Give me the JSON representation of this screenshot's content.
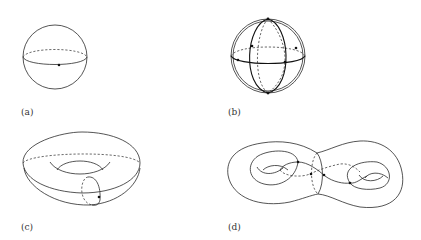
{
  "figure": {
    "panels": [
      {
        "id": "a",
        "label": "(a)",
        "description": "sphere with equator and marked point"
      },
      {
        "id": "b",
        "label": "(b)",
        "description": "sphere with great circles and marked points"
      },
      {
        "id": "c",
        "label": "(c)",
        "description": "torus with meridian circle and marked point"
      },
      {
        "id": "d",
        "label": "(d)",
        "description": "genus-two surface with curves and marked points"
      }
    ]
  }
}
